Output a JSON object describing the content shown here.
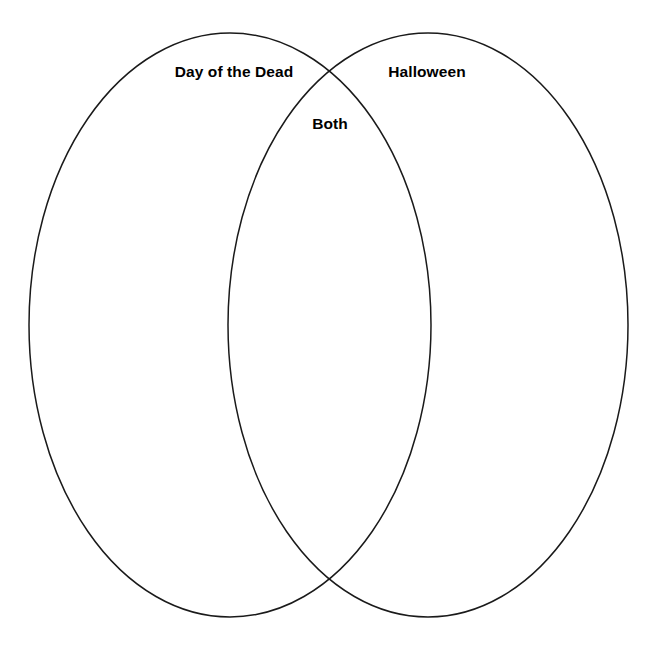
{
  "diagram": {
    "kind": "venn-diagram",
    "set_count": 2,
    "background_color": "#ffffff",
    "stroke_color": "#1a1a1a",
    "text_color": "#000000",
    "width": 660,
    "height": 648,
    "left_set": {
      "label": "Day of the Dead",
      "label_x": 234,
      "label_y": 72,
      "ellipse": {
        "cx": 230,
        "cy": 325,
        "rx": 201,
        "ry": 292
      }
    },
    "right_set": {
      "label": "Halloween",
      "label_x": 427,
      "label_y": 72,
      "ellipse": {
        "cx": 428,
        "cy": 325,
        "rx": 200,
        "ry": 292
      }
    },
    "intersection": {
      "label": "Both",
      "label_x": 330,
      "label_y": 124
    }
  }
}
